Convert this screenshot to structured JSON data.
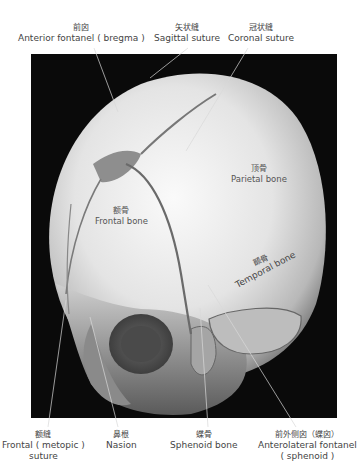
{
  "figure": {
    "overlay_text": "W/L",
    "background_color": "#0a0a0a",
    "label_color": "#444444"
  },
  "top_labels": [
    {
      "cn": "前囟",
      "en": "Anterior fontanel ( bregma )"
    },
    {
      "cn": "矢状缝",
      "en": "Sagittal suture"
    },
    {
      "cn": "冠状缝",
      "en": "Coronal suture"
    }
  ],
  "inner_labels": [
    {
      "cn": "顶骨",
      "en": "Parietal bone"
    },
    {
      "cn": "额骨",
      "en": "Frontal bone"
    },
    {
      "cn": "颞骨",
      "en": "Temporal bone"
    }
  ],
  "bottom_labels": [
    {
      "cn": "额缝",
      "en": "Frontal ( metopic )",
      "en2": "suture"
    },
    {
      "cn": "鼻根",
      "en": "Nasion"
    },
    {
      "cn": "蝶骨",
      "en": "Sphenoid bone"
    },
    {
      "cn": "前外侧囟（蝶囟）",
      "en": "Anterolateral fontanel",
      "en2": "( sphenoid )"
    }
  ]
}
